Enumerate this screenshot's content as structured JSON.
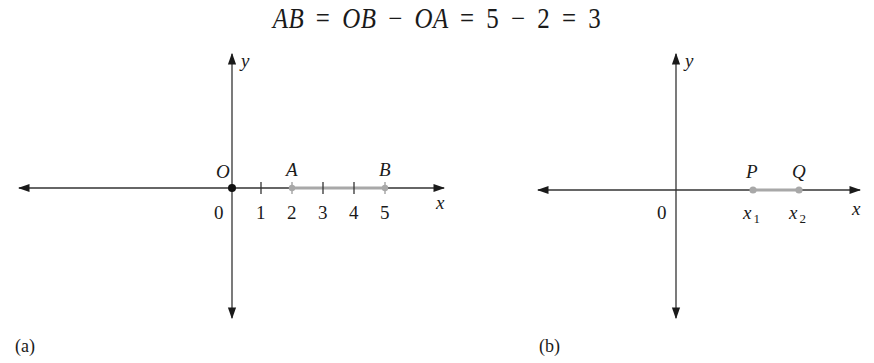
{
  "equation": {
    "lhs": "AB",
    "eq1": "=",
    "term1": "OB",
    "minus1": "−",
    "term2": "OA",
    "eq2": "=",
    "n1": "5",
    "minus2": "−",
    "n2": "2",
    "eq3": "=",
    "result": "3"
  },
  "figure_a": {
    "caption": "(a)",
    "x_axis_label": "x",
    "y_axis_label": "y",
    "origin_label": "O",
    "origin_value": "0",
    "ticks": [
      "1",
      "2",
      "3",
      "4",
      "5"
    ],
    "points": [
      {
        "name": "A",
        "value": 2
      },
      {
        "name": "B",
        "value": 5
      }
    ],
    "segment_color": "#a8a8a8",
    "origin_dot_color": "#111111"
  },
  "figure_b": {
    "caption": "(b)",
    "x_axis_label": "x",
    "y_axis_label": "y",
    "origin_value": "0",
    "points": [
      {
        "name": "P",
        "coord": "x",
        "sub": "1"
      },
      {
        "name": "Q",
        "coord": "x",
        "sub": "2"
      }
    ],
    "segment_color": "#a8a8a8"
  }
}
